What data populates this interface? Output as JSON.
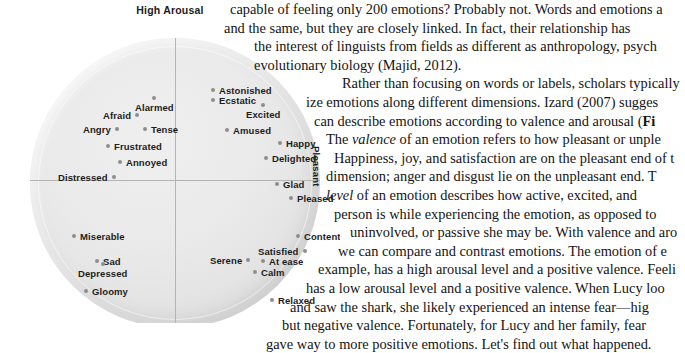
{
  "figure": {
    "title": "High Arousal",
    "axis_labels": {
      "left_vertical": "Unpleasant",
      "right_vertical": "Pleasant"
    },
    "colors": {
      "circle_fill": "#e8e8e8",
      "axis_line": "#b4b4b4",
      "dot": "#8e8e8e",
      "text": "#1d1d1d"
    },
    "emotions": [
      {
        "label": "Astonished",
        "dot": "left",
        "x": 181,
        "y": 47
      },
      {
        "label": "Ecstatic",
        "dot": "left",
        "x": 181,
        "y": 57
      },
      {
        "label": "Alarmed",
        "dot": "above",
        "x": 105,
        "y": 59
      },
      {
        "label": "Afraid",
        "dot": "right",
        "x": 73,
        "y": 72
      },
      {
        "label": "Excited",
        "dot": "above",
        "x": 216,
        "y": 66
      },
      {
        "label": "Angry",
        "dot": "right",
        "x": 53,
        "y": 86
      },
      {
        "label": "Tense",
        "dot": "left",
        "x": 113,
        "y": 86
      },
      {
        "label": "Amused",
        "dot": "left",
        "x": 195,
        "y": 87
      },
      {
        "label": "Happy",
        "dot": "left",
        "x": 248,
        "y": 100
      },
      {
        "label": "Frustrated",
        "dot": "left",
        "x": 76,
        "y": 103
      },
      {
        "label": "Delighted",
        "dot": "left",
        "x": 234,
        "y": 115
      },
      {
        "label": "Annoyed",
        "dot": "left",
        "x": 88,
        "y": 119
      },
      {
        "label": "Glad",
        "dot": "left",
        "x": 245,
        "y": 141
      },
      {
        "label": "Distressed",
        "dot": "right",
        "x": 28,
        "y": 134
      },
      {
        "label": "Pleased",
        "dot": "left",
        "x": 259,
        "y": 155
      },
      {
        "label": "Miserable",
        "dot": "left",
        "x": 42,
        "y": 193
      },
      {
        "label": "Content",
        "dot": "left",
        "x": 266,
        "y": 193
      },
      {
        "label": "Satisfied",
        "dot": "right",
        "x": 228,
        "y": 208
      },
      {
        "label": "Sad",
        "dot": "left",
        "x": 65,
        "y": 218
      },
      {
        "label": "Serene",
        "dot": "right",
        "x": 180,
        "y": 217
      },
      {
        "label": "At ease",
        "dot": "left",
        "x": 231,
        "y": 218
      },
      {
        "label": "Depressed",
        "dot": "above",
        "x": 48,
        "y": 225
      },
      {
        "label": "Calm",
        "dot": "left",
        "x": 223,
        "y": 229
      },
      {
        "label": "Gloomy",
        "dot": "left",
        "x": 54,
        "y": 248
      },
      {
        "label": "Relaxed",
        "dot": "left",
        "x": 240,
        "y": 257
      },
      {
        "label": "Bored",
        "dot": "left",
        "x": 82,
        "y": 287
      },
      {
        "label": "Droopy",
        "dot": "right",
        "x": 89,
        "y": 297
      },
      {
        "label": "Tired",
        "dot": "above",
        "x": 170,
        "y": 292
      },
      {
        "label": "Sleepy",
        "dot": "left",
        "x": 201,
        "y": 300
      }
    ]
  },
  "body_text": {
    "lines": [
      "capable of feeling only 200 emotions? Probably not. Words and emotions a",
      "and the same, but they are closely linked. In fact, their relationship has",
      "the interest of linguists from fields as different as anthropology, psych",
      "evolutionary biology (Majid, 2012).",
      "Rather than focusing on words or labels, scholars typically",
      "ize emotions along different dimensions. Izard (2007) sugges",
      "can describe emotions according to valence and arousal (Fi",
      "The valence of an emotion refers to how pleasant or unple",
      "Happiness, joy, and satisfaction are on the pleasant end of t",
      "dimension; anger and disgust lie on the unpleasant end. T",
      "level of an emotion describes how active, excited, and",
      "person is while experiencing the emotion, as opposed to",
      "uninvolved, or passive she may be. With valence and aro",
      "we can compare and contrast emotions. The emotion of e",
      "example, has a high arousal level and a positive valence. Feeli",
      "has a low arousal level and a positive valence. When Lucy loo",
      "and saw the shark, she likely experienced an intense fear—hig",
      "but negative valence. Fortunately, for Lucy and her family, fear",
      "gave way to more positive emotions. Let's find out what happened."
    ],
    "line_meta": [
      {
        "indent": 8,
        "italic_word": ""
      },
      {
        "indent": 2,
        "italic_word": ""
      },
      {
        "indent": 32,
        "italic_word": ""
      },
      {
        "indent": 32,
        "italic_word": ""
      },
      {
        "indent": 120,
        "italic_word": ""
      },
      {
        "indent": 84,
        "italic_word": ""
      },
      {
        "indent": 92,
        "italic_word": "",
        "bold_tail": "Fi"
      },
      {
        "indent": 104,
        "italic_word": "valence"
      },
      {
        "indent": 112,
        "italic_word": ""
      },
      {
        "indent": 104,
        "italic_word": ""
      },
      {
        "indent": 104,
        "italic_word": "level"
      },
      {
        "indent": 112,
        "italic_word": ""
      },
      {
        "indent": 128,
        "italic_word": ""
      },
      {
        "indent": 116,
        "italic_word": ""
      },
      {
        "indent": 96,
        "italic_word": ""
      },
      {
        "indent": 84,
        "italic_word": ""
      },
      {
        "indent": 68,
        "italic_word": ""
      },
      {
        "indent": 60,
        "italic_word": ""
      },
      {
        "indent": 44,
        "italic_word": ""
      }
    ]
  }
}
